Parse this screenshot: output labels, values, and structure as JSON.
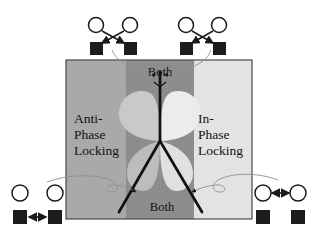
{
  "figure": {
    "type": "phase-diagram",
    "panel": {
      "x": 66,
      "y": 60,
      "width": 186,
      "height": 159,
      "border_color": "#3a3a3a",
      "background_left_color": "#a8a8a8",
      "background_right_color": "#e2e2e2",
      "center_band_color": "#8e8e8e",
      "lobe_color": "#d9d9d9"
    },
    "separatrix": {
      "color": "#111111",
      "stroke_width": 2.6,
      "junction": {
        "x": 160,
        "y": 141
      },
      "branches": [
        {
          "name": "upper-vertical",
          "x2": 160,
          "y2": 72
        },
        {
          "name": "lower-left-diagonal",
          "x2": 120,
          "y2": 212
        },
        {
          "name": "lower-right-diagonal",
          "x2": 202,
          "y2": 212
        }
      ]
    }
  },
  "regions": {
    "left": {
      "name": "anti-phase-locking",
      "lines": [
        "Anti-",
        "Phase",
        "Locking"
      ]
    },
    "right": {
      "name": "in-phase-locking",
      "lines": [
        "In-",
        "Phase",
        "Locking"
      ]
    },
    "top_center": {
      "name": "both-top",
      "label": "Both"
    },
    "bottom_center": {
      "name": "both-bottom",
      "label": "Both"
    }
  },
  "insets": {
    "top_left": {
      "name": "inset-anti-phase-both-top",
      "top_nodes": "open-circles",
      "bottom_nodes": "filled-squares",
      "coupling": "crossed-arrows",
      "coupling_symbol": "X"
    },
    "top_right": {
      "name": "inset-in-phase-both-top",
      "top_nodes": "open-circles",
      "bottom_nodes": "filled-squares",
      "coupling": "crossed-arrows",
      "coupling_symbol": "X"
    },
    "bottom_left": {
      "name": "inset-anti-phase-locking",
      "top_nodes": "open-circles",
      "bottom_nodes": "filled-squares",
      "coupling": "horizontal-double-arrow-squares",
      "coupling_symbol": "<->"
    },
    "bottom_right": {
      "name": "inset-in-phase-locking",
      "top_nodes": "open-circles",
      "bottom_nodes": "filled-squares",
      "coupling": "horizontal-double-arrow-circles",
      "coupling_symbol": "<->"
    }
  },
  "colors": {
    "ink": "#111111",
    "node_outline": "#1a1a1a",
    "node_fill": "#ffffff",
    "square_fill": "#1c1c1c",
    "connector_curve": "#8c8c8c",
    "page_background": "#ffffff"
  }
}
